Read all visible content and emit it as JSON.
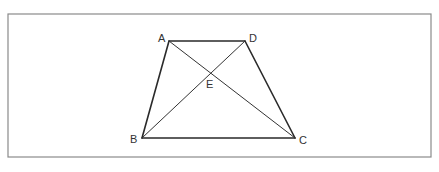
{
  "diagram": {
    "type": "trapezoid-with-diagonals",
    "frame": {
      "x": 8,
      "y": 14,
      "width": 423,
      "height": 143,
      "stroke": "#8a8a8a"
    },
    "points": {
      "A": {
        "label": "A",
        "x": 169,
        "y": 41,
        "lx": 158,
        "ly": 42
      },
      "D": {
        "label": "D",
        "x": 245,
        "y": 41,
        "lx": 249,
        "ly": 42
      },
      "B": {
        "label": "B",
        "x": 142,
        "y": 138,
        "lx": 130,
        "ly": 143
      },
      "C": {
        "label": "C",
        "x": 295,
        "y": 138,
        "lx": 299,
        "ly": 144
      },
      "E": {
        "label": "E",
        "x": 210,
        "y": 73,
        "lx": 206,
        "ly": 88
      }
    },
    "sides": [
      {
        "from": "A",
        "to": "D"
      },
      {
        "from": "D",
        "to": "C"
      },
      {
        "from": "C",
        "to": "B"
      },
      {
        "from": "B",
        "to": "A"
      }
    ],
    "diagonals": [
      {
        "from": "A",
        "to": "C"
      },
      {
        "from": "B",
        "to": "D"
      }
    ],
    "line_color": "#2a2a2a",
    "label_color": "#333333"
  }
}
